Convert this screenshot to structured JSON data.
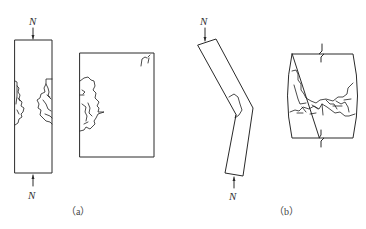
{
  "figure": {
    "panels": [
      {
        "id": "a",
        "caption": "（a）",
        "description": "Axially loaded short column: full column elevation with crushing on both sides at mid-height, and close-up of failure zone",
        "load_label_top": "N",
        "load_label_bottom": "N"
      },
      {
        "id": "b",
        "caption": "（b）",
        "description": "Eccentrically loaded slender column buckled laterally with crushing on concave side, and close-up of failure zone with break lines",
        "load_label_top": "N",
        "load_label_bottom": "N"
      }
    ],
    "colors": {
      "stroke": "#2a2a2a",
      "background": "#ffffff"
    }
  }
}
